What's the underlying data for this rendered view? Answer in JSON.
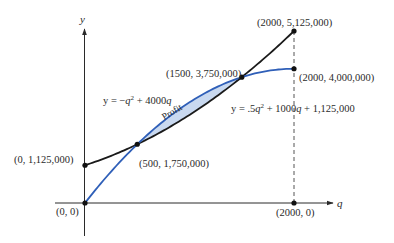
{
  "diagram": {
    "axes": {
      "x_label": "q",
      "y_label": "y"
    },
    "curves": {
      "revenue": {
        "name": "revenue-curve",
        "equation_parts": {
          "prefix": "y = −",
          "var1": "q",
          "exp": "2",
          "mid": " + 4000",
          "var2": "q"
        },
        "color": "#2f5fb8"
      },
      "cost": {
        "name": "cost-curve",
        "equation_parts": {
          "prefix": "y = .5",
          "var1": "q",
          "exp": "2",
          "mid": " + 1000",
          "var2": "q",
          "suffix": " + 1,125,000"
        },
        "color": "#1a1a1a"
      }
    },
    "region": {
      "label": "Profit",
      "fill": "#c9d9f0"
    },
    "points": [
      {
        "id": "origin",
        "label": "(0, 0)",
        "q": 0,
        "y": 0
      },
      {
        "id": "cost-intercept",
        "label": "(0, 1,125,000)",
        "q": 0,
        "y": 1125000
      },
      {
        "id": "break-even-1",
        "label": "(500, 1,750,000)",
        "q": 500,
        "y": 1750000
      },
      {
        "id": "break-even-2",
        "label": "(1500, 3,750,000)",
        "q": 1500,
        "y": 3750000
      },
      {
        "id": "revenue-end",
        "label": "(2000, 4,000,000)",
        "q": 2000,
        "y": 4000000
      },
      {
        "id": "cost-end",
        "label": "(2000, 5,125,000)",
        "q": 2000,
        "y": 5125000
      },
      {
        "id": "q-2000",
        "label": "(2000, 0)",
        "q": 2000,
        "y": 0
      }
    ]
  },
  "chart_data": {
    "type": "line",
    "title": "",
    "xlabel": "q",
    "ylabel": "y",
    "xlim": [
      0,
      2000
    ],
    "ylim": [
      0,
      5125000
    ],
    "grid": false,
    "series": [
      {
        "name": "y = −q² + 4000q",
        "x": [
          0,
          500,
          1000,
          1500,
          2000
        ],
        "values": [
          0,
          1750000,
          3000000,
          3750000,
          4000000
        ]
      },
      {
        "name": "y = .5q² + 1000q + 1,125,000",
        "x": [
          0,
          500,
          1000,
          1500,
          2000
        ],
        "values": [
          1125000,
          1750000,
          2625000,
          3750000,
          5125000
        ]
      }
    ],
    "annotations": [
      "(0, 0)",
      "(0, 1,125,000)",
      "(500, 1,750,000)",
      "(1500, 3,750,000)",
      "(2000, 4,000,000)",
      "(2000, 5,125,000)",
      "(2000, 0)",
      "Profit"
    ],
    "shaded_region": {
      "label": "Profit",
      "from_q": 500,
      "to_q": 1500
    }
  }
}
